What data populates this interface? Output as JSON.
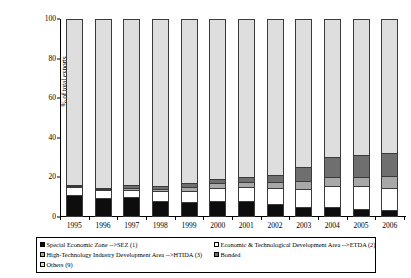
{
  "chart_data": {
    "type": "bar",
    "subtype": "stacked-bar-100",
    "title": "",
    "xlabel": "",
    "ylabel": "% of total exports",
    "ylim": [
      0,
      100
    ],
    "yticks": [
      0,
      20,
      40,
      60,
      80,
      100
    ],
    "grid": false,
    "legend_position": "bottom",
    "categories": [
      "1995",
      "1996",
      "1997",
      "1998",
      "1999",
      "2000",
      "2001",
      "2002",
      "2003",
      "2004",
      "2005",
      "2006"
    ],
    "series": [
      {
        "name": "Special Economic Zone -->SEZ (1)",
        "color": "#0d0d0d",
        "values": [
          10.5,
          9,
          9.5,
          7.5,
          7,
          7.5,
          7.5,
          6,
          4.5,
          4.5,
          3.5,
          3
        ]
      },
      {
        "name": "Economic & Technological Development Area -->ETDA (2)",
        "color": "#ffffff",
        "values": [
          4.5,
          4.5,
          4,
          5,
          5.5,
          7,
          7.5,
          8.5,
          9.5,
          11,
          12,
          11.5
        ]
      },
      {
        "name": "High-Technology Industry Development Area -->HTIDA (3)",
        "color": "#a8a8a8",
        "values": [
          0.5,
          0.5,
          1,
          1.5,
          2.5,
          2.5,
          2.5,
          3,
          4,
          4.5,
          4.5,
          6
        ]
      },
      {
        "name": "Bonded",
        "color": "#6f6f6f",
        "values": [
          0.5,
          0.5,
          1.5,
          1.5,
          2,
          2,
          2.5,
          3.5,
          7,
          10,
          11,
          11.5
        ]
      },
      {
        "name": "Others (9)",
        "color": "#dedede",
        "values": [
          84,
          85.5,
          84,
          84.5,
          83,
          81,
          80,
          79,
          75,
          70,
          69,
          68
        ]
      }
    ]
  },
  "legend": {
    "row1": {
      "left_label": "Special Economic Zone -->SEZ (1)",
      "right_label": "Economic & Technological Development Area -->ETDA (2)"
    },
    "row2": {
      "left_label": "High-Technology Industry Development Area -->HTIDA (3)",
      "right_label": "Bonded"
    },
    "row3": {
      "left_label": "Others (9)"
    }
  }
}
